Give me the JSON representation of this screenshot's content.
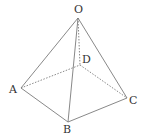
{
  "diagram": {
    "type": "square-pyramid",
    "vertices": {
      "O": {
        "label": "O",
        "x": 78,
        "y": 18,
        "lx": 74,
        "ly": 13
      },
      "D": {
        "label": "D",
        "x": 80,
        "y": 65,
        "lx": 82,
        "ly": 63
      },
      "A": {
        "label": "A",
        "x": 21,
        "y": 88,
        "lx": 9,
        "ly": 93
      },
      "B": {
        "label": "B",
        "x": 68,
        "y": 122,
        "lx": 63,
        "ly": 133
      },
      "C": {
        "label": "C",
        "x": 127,
        "y": 98,
        "lx": 129,
        "ly": 104
      }
    },
    "solid_edges": [
      [
        "O",
        "A"
      ],
      [
        "O",
        "B"
      ],
      [
        "O",
        "C"
      ],
      [
        "A",
        "B"
      ],
      [
        "B",
        "C"
      ]
    ],
    "dashed_edges": [
      [
        "O",
        "D"
      ],
      [
        "A",
        "D"
      ],
      [
        "D",
        "C"
      ]
    ],
    "line_color": "#7a7a7a"
  }
}
